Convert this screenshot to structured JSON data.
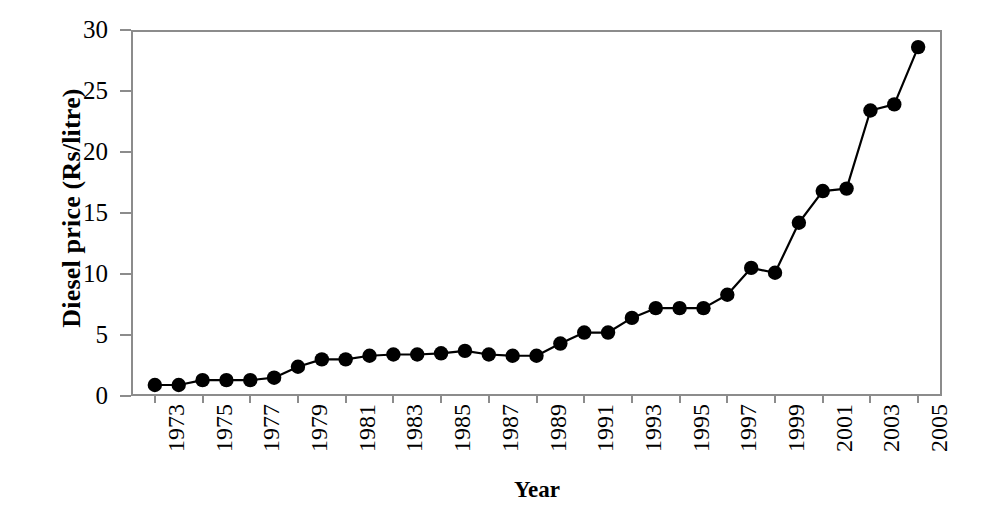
{
  "chart_data": {
    "type": "line",
    "title": "",
    "subtitle": "",
    "xlabel": "Year",
    "ylabel": "Diesel price (Rs/litre)",
    "xlim": [
      1972,
      2006
    ],
    "ylim": [
      0,
      30
    ],
    "ytick_values": [
      0,
      5,
      10,
      15,
      20,
      25,
      30
    ],
    "ytick_labels": [
      "0",
      "5",
      "10",
      "15",
      "20",
      "25",
      "30"
    ],
    "xtick_labels": [
      "1973",
      "1975",
      "1977",
      "1979",
      "1981",
      "1983",
      "1985",
      "1987",
      "1989",
      "1991",
      "1993",
      "1995",
      "1997",
      "1999",
      "2001",
      "2003",
      "2005"
    ],
    "xtick_values": [
      1973,
      1975,
      1977,
      1979,
      1981,
      1983,
      1985,
      1987,
      1989,
      1991,
      1993,
      1995,
      1997,
      1999,
      2001,
      2003,
      2005
    ],
    "xtick_rotation": -90,
    "grid": false,
    "legend": false,
    "legend_position": "none",
    "marker": "filled-circle",
    "marker_color": "#000000",
    "line_color": "#000000",
    "x": [
      1973,
      1974,
      1975,
      1976,
      1977,
      1978,
      1979,
      1980,
      1981,
      1982,
      1983,
      1984,
      1985,
      1986,
      1987,
      1988,
      1989,
      1990,
      1991,
      1992,
      1993,
      1994,
      1995,
      1996,
      1997,
      1998,
      1999,
      2000,
      2001,
      2002,
      2003,
      2004,
      2005
    ],
    "values": [
      0.9,
      0.9,
      1.3,
      1.3,
      1.3,
      1.5,
      2.4,
      3.0,
      3.0,
      3.3,
      3.4,
      3.4,
      3.5,
      3.7,
      3.4,
      3.3,
      3.3,
      4.3,
      5.2,
      5.2,
      6.4,
      7.2,
      7.2,
      7.2,
      8.3,
      10.5,
      10.1,
      14.2,
      16.8,
      17.0,
      23.4,
      23.9,
      28.6
    ],
    "series": [
      {
        "name": "Diesel price",
        "values": [
          0.9,
          0.9,
          1.3,
          1.3,
          1.3,
          1.5,
          2.4,
          3.0,
          3.0,
          3.3,
          3.4,
          3.4,
          3.5,
          3.7,
          3.4,
          3.3,
          3.3,
          4.3,
          5.2,
          5.2,
          6.4,
          7.2,
          7.2,
          7.2,
          8.3,
          10.5,
          10.1,
          14.2,
          16.8,
          17.0,
          23.4,
          23.9,
          28.6
        ]
      }
    ]
  },
  "axes": {
    "frame_color": "#8c8c8c",
    "background": "#ffffff"
  }
}
